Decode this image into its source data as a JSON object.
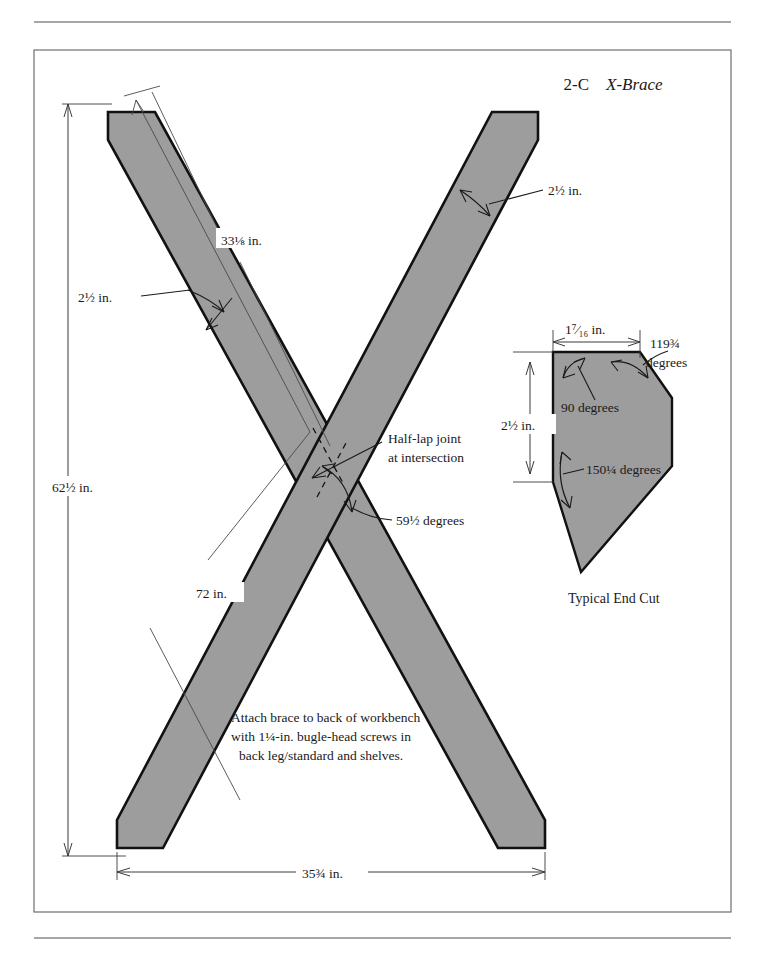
{
  "page": {
    "title_number": "2-C",
    "title_name": "X-Brace",
    "background": "#ffffff",
    "board_fill": "#9d9d9d",
    "line_color": "#111111"
  },
  "main_drawing": {
    "name": "x-brace-assembly",
    "dimensions": {
      "overall_height": "62½ in.",
      "overall_width": "35¾ in.",
      "brace_length_long": "72 in.",
      "brace_length_short": "33⅛ in.",
      "board_width_left": "2½ in.",
      "board_width_right": "2½ in.",
      "intersection_angle": "59½ degrees"
    },
    "callouts": {
      "half_lap_line1": "Half-lap joint",
      "half_lap_line2": "at intersection"
    },
    "note": {
      "line1": "Attach brace to back of workbench",
      "line2": "with 1¼-in. bugle-head screws in",
      "line3": "back leg/standard and shelves."
    }
  },
  "detail_drawing": {
    "name": "typical-end-cut",
    "caption": "Typical End Cut",
    "dimensions": {
      "top_width": "1⁷⁄₁₆ in.",
      "side_height": "2½ in."
    },
    "angles": {
      "upper_left": "90 degrees",
      "upper_right_line1": "119¾",
      "upper_right_line2": "degrees",
      "lower_left": "150¼ degrees"
    }
  }
}
